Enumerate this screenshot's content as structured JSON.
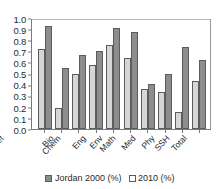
{
  "chart_data": {
    "type": "bar",
    "title": "",
    "xlabel": "",
    "ylabel": "",
    "ylim": [
      0.0,
      1.0
    ],
    "grid": false,
    "legend_position": "bottom-center",
    "categories": [
      "Agri and vet",
      "Bio",
      "Chem",
      "Eng",
      "Env",
      "Math",
      "Med",
      "Phy",
      "SSH",
      "Total"
    ],
    "ytick_labels": [
      "1.0",
      "0.9",
      "0.8",
      "0.7",
      "0.6",
      "0.5",
      "0.4",
      "0.3",
      "0.2",
      "0.1",
      "0.0"
    ],
    "ytick_values": [
      1.0,
      0.9,
      0.8,
      0.7,
      0.6,
      0.5,
      0.4,
      0.3,
      0.2,
      0.1,
      0.0
    ],
    "series": [
      {
        "name": "Jordan 2000 (%)",
        "color": "#d6d6d6",
        "values": [
          0.72,
          0.19,
          0.5,
          0.58,
          0.76,
          0.64,
          0.36,
          0.33,
          0.155,
          0.43
        ]
      },
      {
        "name": "2010 (%)",
        "color": "#8d8d8d",
        "values": [
          0.93,
          0.55,
          0.67,
          0.7,
          0.91,
          0.87,
          0.41,
          0.5,
          0.74,
          0.62
        ]
      }
    ]
  },
  "legend": {
    "items": [
      {
        "label": "Jordan 2000 (%)"
      },
      {
        "label": "2010 (%)"
      }
    ]
  }
}
